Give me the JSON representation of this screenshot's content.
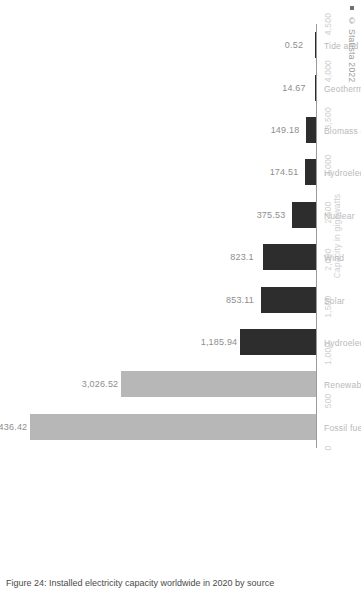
{
  "chart_data": {
    "type": "bar",
    "title": "",
    "orientation": "vertical-rotated",
    "categories": [
      "Fossil fuels",
      "Renewables",
      "Hydroelectricity",
      "Solar",
      "Wind",
      "Nuclear",
      "Hydroelectric pumped storage",
      "Biomass and waste",
      "Geothermal",
      "Tide and wave"
    ],
    "values": [
      4436.42,
      3026.52,
      1185.94,
      853.11,
      823.1,
      375.53,
      174.51,
      149.18,
      14.67,
      0.52
    ],
    "value_labels": [
      "4,436.42",
      "3,026.52",
      "1,185.94",
      "853.11",
      "823.1",
      "375.53",
      "174.51",
      "149.18",
      "14.67",
      "0.52"
    ],
    "bar_colors": [
      "#b7b7b7",
      "#b7b7b7",
      "#2d2d2d",
      "#2d2d2d",
      "#2d2d2d",
      "#2d2d2d",
      "#2d2d2d",
      "#2d2d2d",
      "#2d2d2d",
      "#2d2d2d"
    ],
    "xlabel": "",
    "ylabel": "Capacity in gigawatts",
    "ylim": [
      0,
      4500
    ],
    "ticks": [
      0,
      500,
      1000,
      1500,
      2000,
      2500,
      3000,
      3500,
      4000,
      4500
    ],
    "tick_labels": [
      "0",
      "500",
      "1,000",
      "1,500",
      "2,000",
      "2,500",
      "3,000",
      "3,500",
      "4,000",
      "4,500"
    ],
    "grid": false,
    "legend": null
  },
  "axis": {
    "value_axis_title": "Capacity in gigawatts"
  },
  "credit": {
    "text": "© Statista 2022",
    "marker": "square-marker"
  },
  "caption": {
    "text": "Figure 24: Installed electricity capacity worldwide in 2020 by source"
  }
}
